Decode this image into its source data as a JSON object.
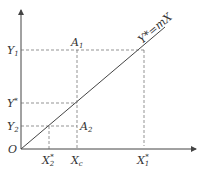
{
  "diagram": {
    "origin_label": "O",
    "line_label": "Y*=mX",
    "y_labels": {
      "y1": "Y",
      "y1_sub": "1",
      "ystar": "Y",
      "ystar_sup": "*",
      "y2": "Y",
      "y2_sub": "2"
    },
    "x_labels": {
      "x2star": "X",
      "x2star_sub": "2",
      "x2star_sup": "*",
      "xc": "X",
      "xc_sub": "c",
      "x1star": "X",
      "x1star_sub": "1",
      "x1star_sup": "*"
    },
    "points": {
      "a1": "A",
      "a1_sub": "1",
      "a2": "A",
      "a2_sub": "2"
    }
  }
}
